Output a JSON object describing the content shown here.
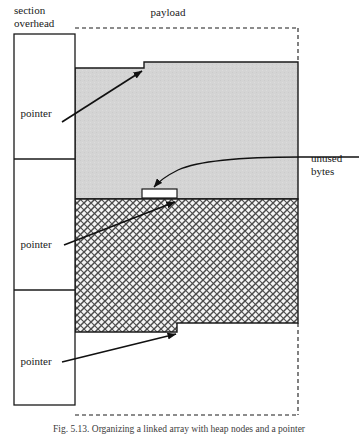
{
  "figure": {
    "title_top_left": "section\noverhead",
    "labels": {
      "section_overhead_line1": "section",
      "section_overhead_line2": "overhead",
      "payload": "payload",
      "unused_line1": "unused",
      "unused_line2": "bytes",
      "pointer_1": "pointer",
      "pointer_2": "pointer",
      "pointer_3": "pointer"
    },
    "caption": "Fig. 5.13. Organizing a linked array with heap nodes and a pointer",
    "colors": {
      "stroke": "#1a1a1a",
      "payload_fill_gray": "#d2d2d2",
      "hatch_fill": "#f2f2f2",
      "hatch_stroke": "#4a4a4a",
      "unused_fill": "#ffffff",
      "background": "#ffffff"
    },
    "geometry": {
      "overhead_column": {
        "x": 14,
        "y": 34,
        "width": 61,
        "height": 371
      },
      "overhead_dividers_y": [
        159,
        290
      ],
      "payload_dashed_box": {
        "x": 75,
        "y": 28,
        "width": 223,
        "height": 387
      },
      "gray_block_top_left_y": 68,
      "gray_block_step_x": 144,
      "gray_block_top_right_y": 62,
      "gray_block_bottom_y": 199,
      "unused_rect": {
        "x": 142,
        "y": 189,
        "width": 35,
        "height": 8
      },
      "hatch_block_top_y": 199,
      "hatch_bottom_left_y": 332,
      "hatch_step_x": 177,
      "hatch_bottom_right_y": 323,
      "block_right_x": 298
    }
  }
}
